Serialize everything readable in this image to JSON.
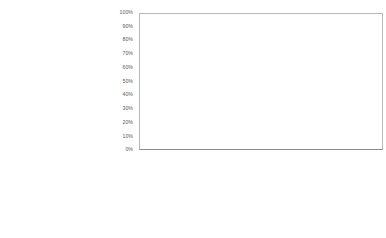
{
  "chart_data": {
    "type": "bar",
    "stacked": true,
    "categories": [
      "Floor room 21 (75)",
      "Courtyard n/oven (173)",
      "Courtyard n/oven (181)",
      "Courtyard (184)",
      "Structural (3459)",
      "Structural (3459/1)"
    ],
    "series": [
      {
        "name": "Triticum/Hordeum/Avena/Cereal infl.",
        "color": "#050505",
        "values": [
          0,
          50.5,
          21.5,
          26,
          26,
          21
        ]
      },
      {
        "name": "Panicum/Setaria type",
        "color": "#939393",
        "values": [
          0,
          0,
          0,
          36,
          37,
          39
        ]
      }
    ],
    "title": "",
    "xlabel": "",
    "ylabel": "",
    "ylim": [
      0,
      100
    ],
    "ytick_labels": [
      "100%",
      "90%",
      "80%",
      "70%",
      "60%",
      "50%",
      "40%",
      "30%",
      "20%",
      "10%",
      "0%"
    ],
    "grid": false,
    "legend_position": "table-row-labels"
  },
  "axis": {
    "ticks": [
      "100%",
      "90%",
      "80%",
      "70%",
      "60%",
      "50%",
      "40%",
      "30%",
      "20%",
      "10%",
      "0%"
    ]
  },
  "table": {
    "headers": [
      {
        "line1": "Floor",
        "line2": "room 21",
        "line3": "(75)"
      },
      {
        "line1": "Courtyard",
        "line2": "n/oven",
        "line3": "(173)"
      },
      {
        "line1": "Courtyard",
        "line2": "n/oven",
        "line3": "(181)"
      },
      {
        "line1": "Courtyard",
        "line2": "(184)",
        "line3": ""
      },
      {
        "line1": "Structural",
        "line2": "(3459)",
        "line3": ""
      },
      {
        "line1": "Structural",
        "line2": "(3459/1)",
        "line3": ""
      }
    ],
    "rows": [
      {
        "label_plain": "Grass stem/leaf",
        "label_italic": "",
        "label_tail": "",
        "key": "none",
        "values": [
          "6",
          "47",
          "98",
          "19",
          "36",
          "39"
        ]
      },
      {
        "label_plain": "",
        "label_italic": "Panicum/Setaria",
        "label_tail": " type",
        "key": "gray",
        "values": [
          "0",
          "0",
          "0",
          "18",
          "37",
          "39"
        ]
      },
      {
        "label_plain": "",
        "label_italic": "Triticum/Hordeum/Avena/Cereal",
        "label_tail": " infl.",
        "key": "black",
        "values": [
          "",
          "49",
          "28",
          "14",
          "27",
          "22"
        ]
      }
    ]
  },
  "colors": {
    "series_cereal": "#050505",
    "series_panicum": "#939393",
    "text": "#4f4f4f",
    "grid": "#c6c6c6"
  }
}
